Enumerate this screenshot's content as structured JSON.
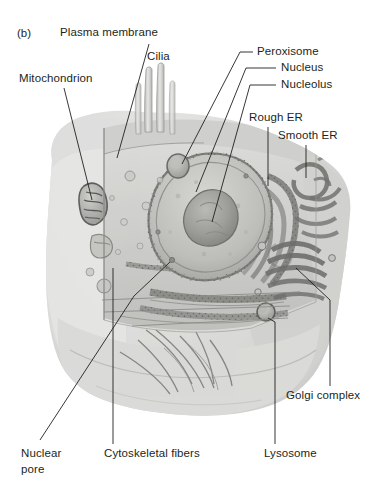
{
  "figure": {
    "panel_id": "(b)",
    "style": "grayscale pencil rendering",
    "background_color": "#ffffff",
    "text_color": "#231f20",
    "leader_line_color": "#231f20"
  },
  "labels": {
    "plasma_membrane": "Plasma membrane",
    "cilia": "Cilia",
    "mitochondrion": "Mitochondrion",
    "peroxisome": "Peroxisome",
    "nucleus": "Nucleus",
    "nucleolus": "Nucleolus",
    "rough_er": "Rough ER",
    "smooth_er": "Smooth ER",
    "golgi_complex": "Golgi complex",
    "lysosome": "Lysosome",
    "cytoskeletal_fibers": "Cytoskeletal fibers",
    "nuclear_pore_line1": "Nuclear",
    "nuclear_pore_line2": "pore"
  },
  "structures": [
    {
      "name": "plasma-membrane",
      "region": "cell outer boundary"
    },
    {
      "name": "cilia",
      "region": "top center projections"
    },
    {
      "name": "mitochondrion",
      "region": "left cytoplasm"
    },
    {
      "name": "peroxisome",
      "region": "upper right of membrane face"
    },
    {
      "name": "nucleus",
      "region": "center"
    },
    {
      "name": "nucleolus",
      "region": "inside nucleus"
    },
    {
      "name": "rough-er",
      "region": "right of nucleus, studded membranes"
    },
    {
      "name": "smooth-er",
      "region": "far right, tubular membranes"
    },
    {
      "name": "golgi-complex",
      "region": "lower right stacked cisternae"
    },
    {
      "name": "lysosome",
      "region": "lower right vesicle"
    },
    {
      "name": "cytoskeletal-fibers",
      "region": "lower center filaments"
    },
    {
      "name": "nuclear-pore",
      "region": "nuclear envelope gap"
    }
  ]
}
